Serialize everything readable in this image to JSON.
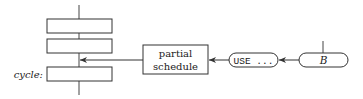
{
  "diagram": {
    "stack": {
      "boxes": [
        {
          "label": ""
        },
        {
          "label": ""
        },
        {
          "label": ""
        }
      ],
      "cycle_label": "cycle:"
    },
    "partial_schedule": {
      "line1": "partial",
      "line2": "schedule"
    },
    "use_node": {
      "label": "USE ..."
    },
    "b_node": {
      "label": "B"
    },
    "colors": {
      "stroke": "#333333",
      "background": "#ffffff"
    }
  }
}
